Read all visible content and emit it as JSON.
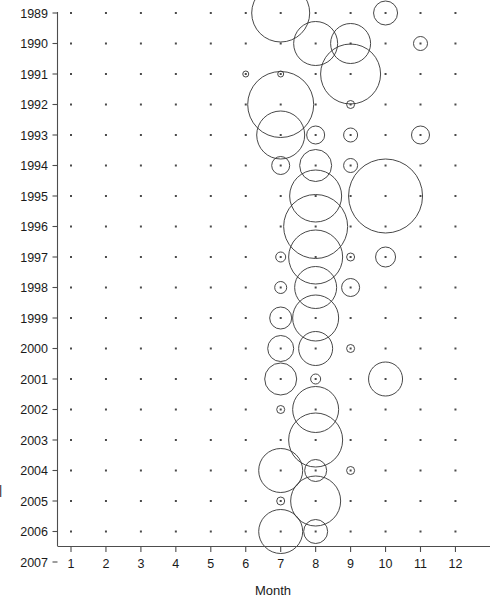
{
  "chart_data": {
    "type": "scatter",
    "subtype": "bubble",
    "title": "",
    "xlabel": "Month",
    "ylabel": "Year",
    "xlim": [
      0.5,
      12.5
    ],
    "ylim": [
      2007.5,
      1988.5
    ],
    "grid": "dot-matrix",
    "legend": "none",
    "x_tick_labels": [
      "1",
      "2",
      "3",
      "4",
      "5",
      "6",
      "7",
      "8",
      "9",
      "10",
      "11",
      "12"
    ],
    "x_ticks": [
      1,
      2,
      3,
      4,
      5,
      6,
      7,
      8,
      9,
      10,
      11,
      12
    ],
    "y_tick_labels": [
      "1989",
      "1990",
      "1991",
      "1992",
      "1993",
      "1994",
      "1995",
      "1996",
      "1997",
      "1998",
      "1999",
      "2000",
      "2001",
      "2002",
      "2003",
      "2004",
      "2005",
      "2006",
      "2007"
    ],
    "y_ticks": [
      1989,
      1990,
      1991,
      1992,
      1993,
      1994,
      1995,
      1996,
      1997,
      1998,
      1999,
      2000,
      2001,
      2002,
      2003,
      2004,
      2005,
      2006,
      2007
    ],
    "bubble_size_units": "radius in pixels",
    "points": [
      {
        "month": 7,
        "year": 1989,
        "r": 29
      },
      {
        "month": 10,
        "year": 1989,
        "r": 12
      },
      {
        "month": 8,
        "year": 1990,
        "r": 22
      },
      {
        "month": 9,
        "year": 1990,
        "r": 20
      },
      {
        "month": 11,
        "year": 1990,
        "r": 7
      },
      {
        "month": 6,
        "year": 1991,
        "r": 3
      },
      {
        "month": 7,
        "year": 1991,
        "r": 3
      },
      {
        "month": 7,
        "year": 1992,
        "r": 33
      },
      {
        "month": 9,
        "year": 1991,
        "r": 30
      },
      {
        "month": 9,
        "year": 1992,
        "r": 4
      },
      {
        "month": 7,
        "year": 1993,
        "r": 24
      },
      {
        "month": 8,
        "year": 1993,
        "r": 9
      },
      {
        "month": 9,
        "year": 1993,
        "r": 7
      },
      {
        "month": 11,
        "year": 1993,
        "r": 9
      },
      {
        "month": 7,
        "year": 1994,
        "r": 9
      },
      {
        "month": 8,
        "year": 1994,
        "r": 16
      },
      {
        "month": 9,
        "year": 1994,
        "r": 7
      },
      {
        "month": 10,
        "year": 1995,
        "r": 37
      },
      {
        "month": 8,
        "year": 1995,
        "r": 26
      },
      {
        "month": 8,
        "year": 1996,
        "r": 32
      },
      {
        "month": 7,
        "year": 1997,
        "r": 5
      },
      {
        "month": 8,
        "year": 1997,
        "r": 27
      },
      {
        "month": 9,
        "year": 1997,
        "r": 4
      },
      {
        "month": 10,
        "year": 1997,
        "r": 10
      },
      {
        "month": 7,
        "year": 1998,
        "r": 6
      },
      {
        "month": 8,
        "year": 1998,
        "r": 21
      },
      {
        "month": 9,
        "year": 1998,
        "r": 9
      },
      {
        "month": 7,
        "year": 1999,
        "r": 11
      },
      {
        "month": 8,
        "year": 1999,
        "r": 23
      },
      {
        "month": 7,
        "year": 2000,
        "r": 13
      },
      {
        "month": 8,
        "year": 2000,
        "r": 17
      },
      {
        "month": 9,
        "year": 2000,
        "r": 4
      },
      {
        "month": 7,
        "year": 2001,
        "r": 16
      },
      {
        "month": 8,
        "year": 2001,
        "r": 5
      },
      {
        "month": 10,
        "year": 2001,
        "r": 17
      },
      {
        "month": 7,
        "year": 2002,
        "r": 4
      },
      {
        "month": 8,
        "year": 2002,
        "r": 23
      },
      {
        "month": 8,
        "year": 2003,
        "r": 27
      },
      {
        "month": 7,
        "year": 2004,
        "r": 22
      },
      {
        "month": 8,
        "year": 2004,
        "r": 11
      },
      {
        "month": 9,
        "year": 2004,
        "r": 4
      },
      {
        "month": 8,
        "year": 2005,
        "r": 25
      },
      {
        "month": 7,
        "year": 2005,
        "r": 4
      },
      {
        "month": 7,
        "year": 2006,
        "r": 22
      },
      {
        "month": 8,
        "year": 2006,
        "r": 12
      }
    ]
  },
  "axes": {
    "x_title": "Month",
    "y_title_partial": "|"
  }
}
